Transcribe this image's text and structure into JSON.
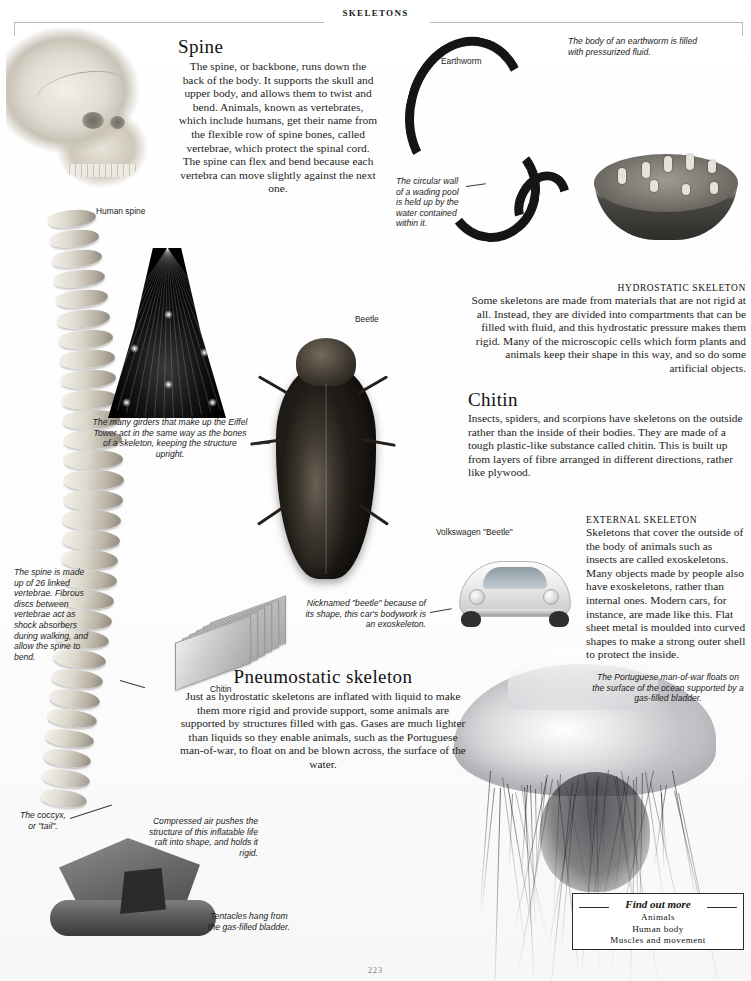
{
  "page": {
    "running_head": "SKELETONS",
    "folio": "223"
  },
  "sections": [
    {
      "id": "spine",
      "heading": "Spine",
      "body": "The spine, or backbone, runs down the back of the body. It supports the skull and upper body, and allows them to twist and bend. Animals, known as vertebrates, which include humans, get their name from the flexible row of spine bones, called vertebrae, which protect the spinal cord. The spine can flex and bend because each vertebra can move slightly against the next one."
    },
    {
      "id": "hydrostatic",
      "heading": "HYDROSTATIC SKELETON",
      "body": "Some skeletons are made from materials that are not rigid at all. Instead, they are divided into compartments that can be filled with fluid, and this hydrostatic pressure makes them rigid. Many of the microscopic cells which form plants and animals keep their shape in this way, and so do some artificial objects."
    },
    {
      "id": "chitin",
      "heading": "Chitin",
      "body": "Insects, spiders, and scorpions have skeletons on the outside rather than the inside of their bodies. They are made of a tough plastic-like substance called chitin. This is built up from layers of fibre arranged in different directions, rather like plywood."
    },
    {
      "id": "external",
      "heading": "EXTERNAL SKELETON",
      "body": "Skeletons that cover the outside of the body of animals such as insects are called exoskeletons. Many objects made by people also have exoskeletons, rather than internal ones. Modern cars, for instance, are made like this. Flat sheet metal is moulded into curved shapes to make a strong outer shell to protect the inside."
    },
    {
      "id": "pneumostatic",
      "heading": "Pneumostatic skeleton",
      "body": "Just as hydrostatic skeletons are inflated with liquid to make them more rigid and provide support, some animals are supported by structures filled with gas. Gases are much lighter than liquids so they enable animals, such as the Portuguese man-of-war, to float on and be blown across, the surface of the water."
    }
  ],
  "labels": {
    "human_spine": "Human spine",
    "earthworm": "Earthworm",
    "beetle": "Beetle",
    "chitin": "Chitin",
    "vw_beetle": "Volkswagen \"Beetle\""
  },
  "captions": {
    "earthworm_fluid": "The body of an earthworm is filled with pressurized fluid.",
    "wading_pool": "The circular wall of a wading pool is held up by the water contained within it.",
    "eiffel": "The many girders that make up the Eiffel Tower act in the same way as the bones of a skeleton, keeping the structure upright.",
    "spine_vertebrae": "The spine is made up of 26 linked vertebrae. Fibrous discs between vertebrae act as shock absorbers during walking, and allow the spine to bend.",
    "nicknamed_beetle": "Nicknamed \"beetle\" because of its shape, this car's bodywork is an exoskeleton.",
    "man_of_war": "The Portuguese man-of-war floats on the surface of the ocean supported by a gas-filled bladder.",
    "coccyx": "The coccyx, or \"tail\".",
    "life_raft": "Compressed air pushes the structure of this inflatable life raft into shape, and holds it rigid.",
    "tentacles": "Tentacles hang from the gas-filled bladder."
  },
  "find_out_more": {
    "title": "Find out more",
    "items": [
      "Animals",
      "Human body",
      "Muscles and movement"
    ]
  },
  "colors": {
    "ink": "#1c1c1c",
    "rule": "#b9b9b9",
    "box_border": "#2a2a2a"
  }
}
